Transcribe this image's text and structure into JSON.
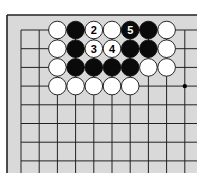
{
  "diagram": {
    "type": "go-board-corner",
    "board": {
      "background": "#d9d9d9",
      "line_color": "#222222",
      "columns_visible": 10,
      "rows_visible": 8,
      "edges": [
        "top",
        "left"
      ],
      "star_points": [
        {
          "col": 9,
          "row": 3
        }
      ]
    },
    "stones": [
      {
        "col": 2,
        "row": 0,
        "color": "white",
        "label": ""
      },
      {
        "col": 3,
        "row": 0,
        "color": "black",
        "label": ""
      },
      {
        "col": 4,
        "row": 0,
        "color": "white",
        "label": "2"
      },
      {
        "col": 5,
        "row": 0,
        "color": "white",
        "label": ""
      },
      {
        "col": 6,
        "row": 0,
        "color": "black",
        "label": "5"
      },
      {
        "col": 7,
        "row": 0,
        "color": "black",
        "label": ""
      },
      {
        "col": 8,
        "row": 0,
        "color": "white",
        "label": ""
      },
      {
        "col": 2,
        "row": 1,
        "color": "white",
        "label": ""
      },
      {
        "col": 3,
        "row": 1,
        "color": "black",
        "label": ""
      },
      {
        "col": 4,
        "row": 1,
        "color": "white",
        "label": "3"
      },
      {
        "col": 5,
        "row": 1,
        "color": "white",
        "label": "4"
      },
      {
        "col": 6,
        "row": 1,
        "color": "black",
        "label": ""
      },
      {
        "col": 7,
        "row": 1,
        "color": "black",
        "label": ""
      },
      {
        "col": 8,
        "row": 1,
        "color": "white",
        "label": ""
      },
      {
        "col": 2,
        "row": 2,
        "color": "white",
        "label": ""
      },
      {
        "col": 3,
        "row": 2,
        "color": "black",
        "label": ""
      },
      {
        "col": 4,
        "row": 2,
        "color": "black",
        "label": ""
      },
      {
        "col": 5,
        "row": 2,
        "color": "black",
        "label": ""
      },
      {
        "col": 6,
        "row": 2,
        "color": "black",
        "label": ""
      },
      {
        "col": 7,
        "row": 2,
        "color": "white",
        "label": ""
      },
      {
        "col": 8,
        "row": 2,
        "color": "white",
        "label": ""
      },
      {
        "col": 2,
        "row": 3,
        "color": "white",
        "label": ""
      },
      {
        "col": 3,
        "row": 3,
        "color": "white",
        "label": ""
      },
      {
        "col": 4,
        "row": 3,
        "color": "white",
        "label": ""
      },
      {
        "col": 5,
        "row": 3,
        "color": "white",
        "label": ""
      },
      {
        "col": 6,
        "row": 3,
        "color": "white",
        "label": ""
      }
    ]
  }
}
